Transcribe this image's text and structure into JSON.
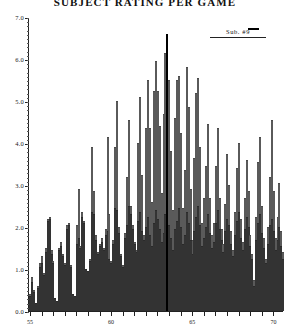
{
  "title": "SUBJECT RATING PER GAME",
  "legend": {
    "label": "Sub.  #9",
    "swatch_color": "#000000"
  },
  "axes": {
    "y": {
      "labels": [
        "0.0",
        "1.0",
        "2.0",
        "3.0",
        "4.0",
        "5.0",
        "6.0",
        "7.0"
      ],
      "min": 0.0,
      "max": 7.0,
      "step": 1.0,
      "title": ""
    },
    "x": {
      "labels": [
        "55",
        "60",
        "65",
        "70"
      ],
      "label_positions": [
        0,
        42,
        84,
        126
      ],
      "min": 52,
      "max": 130,
      "title": ""
    }
  },
  "chart_data": {
    "type": "bar",
    "title": "SUBJECT RATING PER GAME",
    "subtitle": "",
    "xlabel": "",
    "ylabel": "",
    "ylim": [
      0.0,
      7.0
    ],
    "yticks": [
      0.0,
      1.0,
      2.0,
      3.0,
      4.0,
      5.0,
      6.0,
      7.0
    ],
    "xticks": [
      55,
      60,
      65,
      70
    ],
    "grid": false,
    "legend_position": "top-right",
    "stacked": true,
    "highlight_index": 71,
    "highlight_color": "#000000",
    "series": [
      {
        "name": "lower-segment",
        "style": "dark-stippled",
        "color": "#6f6f6f",
        "values": [
          0.35,
          0.7,
          0.45,
          0.2,
          0.55,
          1.05,
          1.15,
          0.85,
          1.4,
          2.15,
          2.2,
          1.35,
          1.15,
          0.3,
          0.25,
          1.45,
          1.55,
          1.3,
          1.1,
          1.95,
          2.05,
          1.05,
          0.4,
          0.35,
          1.6,
          1.75,
          1.5,
          2.25,
          2.1,
          1.0,
          0.95,
          1.2,
          2.35,
          2.3,
          1.7,
          1.35,
          1.55,
          1.65,
          1.45,
          1.8,
          1.9,
          1.25,
          1.15,
          1.6,
          2.45,
          2.4,
          1.85,
          1.3,
          1.05,
          1.75,
          2.05,
          2.5,
          2.3,
          1.95,
          1.6,
          1.4,
          2.15,
          2.35,
          1.9,
          1.7,
          2.0,
          2.25,
          1.8,
          1.55,
          2.1,
          2.4,
          2.2,
          1.95,
          1.65,
          1.85,
          2.3,
          2.55,
          2.05,
          1.75,
          1.45,
          1.95,
          2.15,
          2.45,
          2.0,
          1.6,
          1.8,
          2.35,
          2.1,
          1.7,
          1.35,
          1.9,
          2.25,
          2.5,
          2.05,
          1.55,
          1.75,
          2.0,
          2.3,
          1.85,
          1.5,
          1.65,
          2.1,
          2.4,
          1.95,
          1.7,
          1.4,
          1.9,
          2.2,
          2.05,
          1.6,
          1.3,
          1.8,
          2.15,
          2.35,
          1.75,
          1.45,
          1.95,
          2.25,
          2.0,
          1.55,
          1.25,
          0.6,
          1.7,
          2.1,
          2.3,
          1.85,
          1.5,
          1.15,
          1.6,
          2.05,
          2.2,
          1.9,
          1.45,
          1.7,
          2.0,
          1.55,
          1.25
        ]
      },
      {
        "name": "upper-segment",
        "style": "light-outlined",
        "color": "#f2f2f2",
        "values": [
          0.05,
          0.1,
          0.05,
          0.0,
          0.05,
          0.1,
          0.15,
          0.05,
          0.1,
          0.05,
          0.05,
          0.1,
          0.05,
          0.0,
          0.0,
          0.05,
          0.1,
          0.05,
          0.05,
          0.1,
          0.05,
          0.05,
          0.0,
          0.0,
          0.45,
          1.15,
          0.05,
          0.1,
          0.05,
          0.0,
          0.0,
          0.05,
          1.55,
          0.55,
          0.1,
          0.05,
          0.05,
          0.1,
          0.05,
          0.15,
          2.25,
          1.05,
          0.05,
          0.1,
          1.45,
          2.6,
          0.15,
          0.05,
          0.05,
          0.1,
          1.15,
          2.05,
          0.2,
          0.1,
          0.05,
          0.05,
          1.85,
          2.75,
          1.35,
          0.1,
          2.35,
          3.25,
          2.55,
          1.05,
          3.15,
          3.55,
          3.05,
          2.45,
          1.15,
          2.85,
          3.85,
          4.05,
          3.45,
          2.05,
          0.95,
          2.65,
          3.35,
          3.15,
          2.25,
          0.85,
          1.55,
          3.45,
          2.75,
          1.2,
          0.35,
          1.75,
          2.95,
          3.05,
          1.85,
          0.55,
          0.95,
          1.45,
          2.15,
          0.85,
          0.3,
          0.45,
          1.35,
          1.95,
          0.75,
          0.25,
          0.2,
          0.65,
          1.55,
          0.95,
          0.3,
          0.15,
          0.55,
          1.25,
          1.65,
          0.45,
          0.2,
          0.75,
          1.35,
          0.85,
          0.25,
          0.1,
          0.15,
          0.55,
          1.45,
          1.85,
          0.65,
          0.25,
          0.1,
          0.4,
          1.15,
          2.35,
          0.95,
          0.3,
          0.55,
          1.05,
          0.35,
          0.15
        ]
      }
    ]
  }
}
